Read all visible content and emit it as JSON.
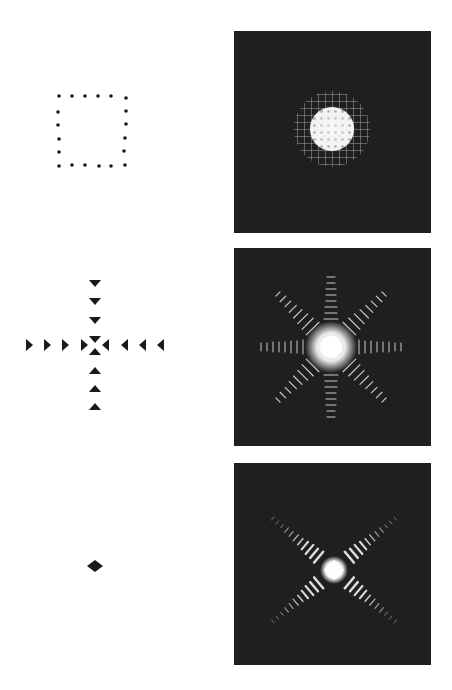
{
  "figure": {
    "rows": [
      {
        "aperture": {
          "shape": "square-of-dots",
          "dots_per_side": 6
        },
        "pattern": {
          "description": "diffraction pattern: bright central disc with grid-like fringes",
          "type": "grid-disc"
        }
      },
      {
        "aperture": {
          "shape": "cross-of-triangles",
          "arm_count": 4,
          "triangles_per_arm": 4
        },
        "pattern": {
          "description": "diffraction pattern: eight-pointed star with fringed rays",
          "type": "star-8"
        }
      },
      {
        "aperture": {
          "shape": "single-diamond"
        },
        "pattern": {
          "description": "diffraction pattern: X-shaped cross with fringed diagonal arms",
          "type": "x-cross"
        }
      }
    ],
    "colors": {
      "panel_bg": "#1f1f1f",
      "marker": "#1a1a1a",
      "light": "#ffffff"
    }
  }
}
